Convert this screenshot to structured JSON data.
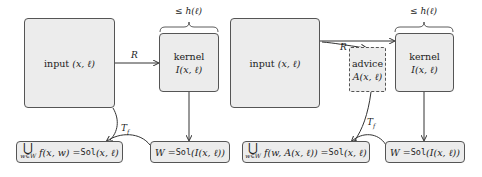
{
  "left_diagram": {
    "input_box": {
      "label": "input",
      "args": "(x, ℓ)"
    },
    "kernel_box": {
      "label": "kernel",
      "expr": "I(x, ℓ)"
    },
    "size_bound": "≤ h(ℓ)",
    "reduction_label": "R",
    "transform_label": "T_f",
    "kernel_solution": {
      "lhs": "W = ",
      "fn": "Sol",
      "arg": "(I(x, ℓ))"
    },
    "original_solution": {
      "union_symbol": "⋃",
      "union_sub": "w∈W",
      "expr": "f(x, w) = ",
      "fn": "Sol",
      "arg": "(x, ℓ)"
    }
  },
  "right_diagram": {
    "input_box": {
      "label": "input",
      "args": "(x, ℓ)"
    },
    "advice_box": {
      "label": "advice",
      "expr": "A(x, ℓ)"
    },
    "kernel_box": {
      "label": "kernel",
      "expr": "I(x, ℓ)"
    },
    "size_bound": "≤ h(ℓ)",
    "reduction_label": "R",
    "transform_label": "T_f",
    "kernel_solution": {
      "lhs": "W = ",
      "fn": "Sol",
      "arg": "(I(x, ℓ))"
    },
    "original_solution": {
      "union_symbol": "⋃",
      "union_sub": "w∈W",
      "expr": "f(w, A(x, ℓ)) = ",
      "fn": "Sol",
      "arg": "(x, ℓ)"
    }
  },
  "colors": {
    "box_fill": "#ececec",
    "stroke": "#555555"
  }
}
